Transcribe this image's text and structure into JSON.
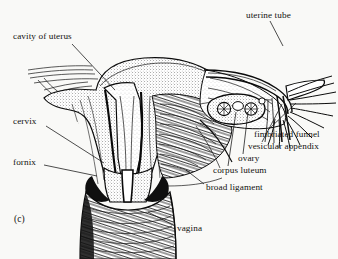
{
  "figure": {
    "panel_label": "(c)",
    "background_color": "#f9f9f7",
    "ink_color": "#121210"
  },
  "labels": [
    {
      "id": "cavity-of-uterus",
      "text": "cavity of uterus",
      "x": 13,
      "y": 37,
      "anchor": "start",
      "leader": {
        "x1": 72,
        "y1": 44,
        "x2": 115,
        "y2": 90
      }
    },
    {
      "id": "uterine-tube",
      "text": "uterine tube",
      "x": 246,
      "y": 16,
      "anchor": "start",
      "leader": {
        "x1": 270,
        "y1": 21,
        "x2": 283,
        "y2": 46
      }
    },
    {
      "id": "cervix",
      "text": "cervix",
      "x": 13,
      "y": 122,
      "anchor": "start",
      "leader": {
        "x1": 46,
        "y1": 126,
        "x2": 104,
        "y2": 163
      }
    },
    {
      "id": "fornix",
      "text": "fornix",
      "x": 13,
      "y": 163,
      "anchor": "start",
      "leader": {
        "x1": 44,
        "y1": 165,
        "x2": 97,
        "y2": 176
      }
    },
    {
      "id": "fimbriated-funnel",
      "text": "fimbriated funnel",
      "x": 254,
      "y": 135,
      "anchor": "start",
      "leader": {
        "x1": 268,
        "y1": 130,
        "x2": 296,
        "y2": 103
      }
    },
    {
      "id": "vesicular-appendix",
      "text": "vesicular appendix",
      "x": 248,
      "y": 147,
      "anchor": "start",
      "leader": {
        "x1": 262,
        "y1": 142,
        "x2": 282,
        "y2": 104
      }
    },
    {
      "id": "ovary",
      "text": "ovary",
      "x": 238,
      "y": 159,
      "anchor": "start",
      "leader": {
        "x1": 243,
        "y1": 154,
        "x2": 248,
        "y2": 112
      }
    },
    {
      "id": "corpus-luteum",
      "text": "corpus luteum",
      "x": 213,
      "y": 171,
      "anchor": "start",
      "leader": {
        "x1": 228,
        "y1": 166,
        "x2": 236,
        "y2": 112
      }
    },
    {
      "id": "broad-ligament",
      "text": "broad ligament",
      "x": 206,
      "y": 188,
      "anchor": "start",
      "leader": {
        "x1": 204,
        "y1": 184,
        "x2": 186,
        "y2": 170
      }
    },
    {
      "id": "vagina",
      "text": "vagina",
      "x": 177,
      "y": 229,
      "anchor": "start",
      "leader": {
        "x1": 175,
        "y1": 226,
        "x2": 148,
        "y2": 212
      }
    }
  ]
}
